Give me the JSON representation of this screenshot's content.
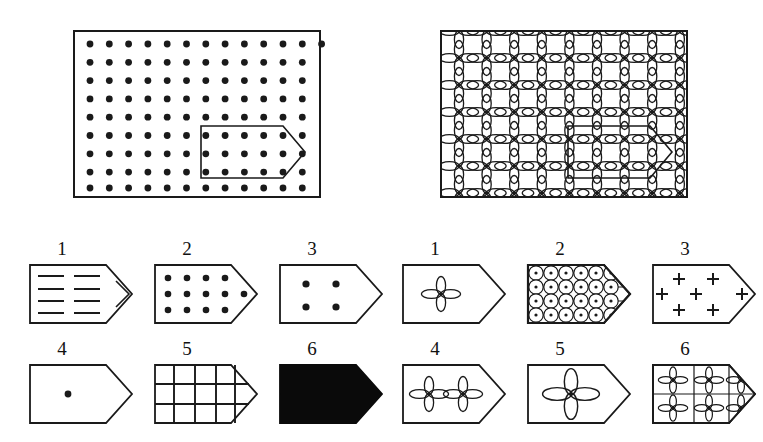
{
  "figure": {
    "type": "visual-analogy-matrix-test",
    "background_color": "#ffffff",
    "ink_color": "#1a1a1a"
  },
  "panels": [
    {
      "id": "left-panel",
      "name": "dot-grid-panel",
      "motif": "filled-dot",
      "columns": 13,
      "rows": 9,
      "border": true,
      "cutout": {
        "shape": "pentagon-arrow",
        "name": "cutout-outline",
        "columns_covered": 5,
        "rows_covered": 3
      }
    },
    {
      "id": "right-panel",
      "name": "flower-grid-panel",
      "motif": "four-petal-flower",
      "columns": 9,
      "rows": 6,
      "border": true,
      "cutout": {
        "shape": "pentagon-arrow",
        "name": "cutout-outline",
        "columns_covered": 3,
        "rows_covered": 2
      }
    }
  ],
  "answer_sets": [
    {
      "id": "left-answers",
      "name": "left-answer-set",
      "options": [
        {
          "number": "1",
          "fill": "horizontal-dashes",
          "name": "option-dashes"
        },
        {
          "number": "2",
          "fill": "dot-grid-dense",
          "name": "option-dots-dense"
        },
        {
          "number": "3",
          "fill": "four-dots",
          "name": "option-four-dots"
        },
        {
          "number": "4",
          "fill": "single-dot",
          "name": "option-single-dot"
        },
        {
          "number": "5",
          "fill": "square-lattice",
          "name": "option-lattice"
        },
        {
          "number": "6",
          "fill": "solid-black",
          "name": "option-solid"
        }
      ]
    },
    {
      "id": "right-answers",
      "name": "right-answer-set",
      "options": [
        {
          "number": "1",
          "fill": "one-flower",
          "name": "option-one-flower"
        },
        {
          "number": "2",
          "fill": "circle-dot-lattice",
          "name": "option-circle-lattice"
        },
        {
          "number": "3",
          "fill": "seven-plus-signs",
          "name": "option-plus-signs"
        },
        {
          "number": "4",
          "fill": "two-flowers",
          "name": "option-two-flowers"
        },
        {
          "number": "5",
          "fill": "one-large-flower",
          "name": "option-large-flower"
        },
        {
          "number": "6",
          "fill": "six-flowers",
          "name": "option-six-flowers"
        }
      ]
    }
  ]
}
